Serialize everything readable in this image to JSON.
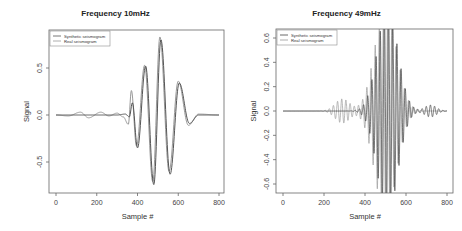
{
  "chart_data": [
    {
      "type": "line",
      "title": "Frequency 10mHz",
      "xlabel": "Sample #",
      "ylabel": "Signal",
      "xlim": [
        0,
        800
      ],
      "ylim": [
        -0.78,
        0.82
      ],
      "xticks": [
        0,
        200,
        400,
        600,
        800
      ],
      "yticks": [
        -0.5,
        0.0,
        0.5
      ],
      "ytick_labels": [
        "-0.5",
        "0.0",
        "0.5"
      ],
      "grid": false,
      "legend_position": "top-left",
      "series": [
        {
          "name": "Synthetic seismogram",
          "color": "#555555",
          "x": [
            0,
            100,
            200,
            300,
            340,
            360,
            375,
            400,
            440,
            480,
            515,
            560,
            605,
            655,
            700,
            800
          ],
          "y": [
            0,
            0,
            0,
            0,
            0.01,
            -0.02,
            0.13,
            -0.35,
            0.52,
            -0.74,
            0.8,
            -0.63,
            0.34,
            -0.09,
            0.0,
            0.0
          ]
        },
        {
          "name": "Real seismogram",
          "color": "#999999",
          "x": [
            0,
            60,
            120,
            160,
            220,
            260,
            300,
            330,
            355,
            370,
            395,
            435,
            475,
            510,
            555,
            600,
            650,
            700,
            800
          ],
          "y": [
            0,
            -0.01,
            0.03,
            -0.03,
            0.03,
            -0.01,
            0.02,
            -0.02,
            -0.1,
            0.26,
            -0.33,
            0.53,
            -0.71,
            0.83,
            -0.6,
            0.36,
            -0.11,
            0.01,
            0.0
          ]
        }
      ]
    },
    {
      "type": "line",
      "title": "Frequency 49mHz",
      "xlabel": "Sample #",
      "ylabel": "Signal",
      "xlim": [
        0,
        800
      ],
      "ylim": [
        -0.7,
        0.7
      ],
      "xticks": [
        0,
        200,
        400,
        600,
        800
      ],
      "yticks": [
        -0.6,
        -0.4,
        -0.2,
        0.0,
        0.2,
        0.4,
        0.6
      ],
      "ytick_labels": [
        "-0.6",
        "-0.4",
        "-0.2",
        "0.0",
        "0.2",
        "0.4",
        "0.6"
      ],
      "grid": false,
      "legend_position": "top-left",
      "series": [
        {
          "name": "Synthetic seismogram",
          "color": "#444444",
          "envelope_peak": 0.85,
          "envelope_center": 510,
          "envelope_width": 70,
          "period_samples": 20.4,
          "tail": {
            "center": 720,
            "amp": 0.05,
            "width": 40
          }
        },
        {
          "name": "Real seismogram",
          "color": "#9a9a9a",
          "envelope_peak": 0.85,
          "envelope_center": 500,
          "envelope_width": 75,
          "period_samples": 20.4,
          "precursor": {
            "center": 290,
            "amp": 0.1,
            "width": 50
          }
        }
      ]
    }
  ],
  "panels": [
    {
      "title": "Frequency 10mHz"
    },
    {
      "title": "Frequency 49mHz"
    }
  ]
}
